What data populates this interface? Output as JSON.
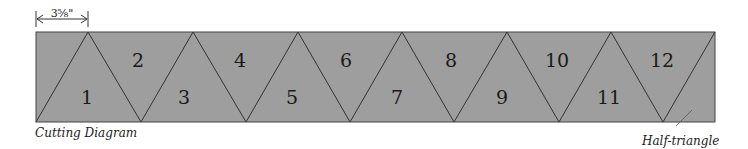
{
  "diagram": {
    "title": "Cutting Diagram",
    "dimension_label": "3⅝\"",
    "callout_label": "Half-triangle",
    "strip_color": "#9e9e9e",
    "line_color": "#333333",
    "strip": {
      "x": 36,
      "y": 32,
      "width": 679,
      "height": 90
    },
    "top_vertices_x": [
      88,
      193,
      298,
      402,
      507,
      611,
      715
    ],
    "bottom_vertices_x": [
      36,
      141,
      246,
      350,
      454,
      559,
      663
    ],
    "pieces": [
      {
        "label": "1",
        "x": 87,
        "y": 104
      },
      {
        "label": "2",
        "x": 138,
        "y": 67
      },
      {
        "label": "3",
        "x": 184,
        "y": 104
      },
      {
        "label": "4",
        "x": 240,
        "y": 67
      },
      {
        "label": "5",
        "x": 292,
        "y": 104
      },
      {
        "label": "6",
        "x": 346,
        "y": 67
      },
      {
        "label": "7",
        "x": 397,
        "y": 104
      },
      {
        "label": "8",
        "x": 451,
        "y": 67
      },
      {
        "label": "9",
        "x": 502,
        "y": 104
      },
      {
        "label": "10",
        "x": 557,
        "y": 67
      },
      {
        "label": "11",
        "x": 609,
        "y": 104
      },
      {
        "label": "12",
        "x": 662,
        "y": 67
      }
    ]
  }
}
